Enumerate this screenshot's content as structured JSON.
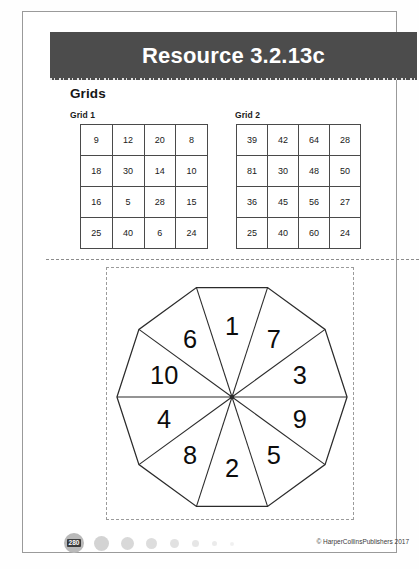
{
  "header": {
    "title": "Resource 3.2.13c",
    "band_color": "#4c4c4c",
    "title_color": "#ffffff"
  },
  "section": {
    "heading": "Grids"
  },
  "grids": [
    {
      "label": "Grid 1",
      "rows": [
        [
          "9",
          "12",
          "20",
          "8"
        ],
        [
          "18",
          "30",
          "14",
          "10"
        ],
        [
          "16",
          "5",
          "28",
          "15"
        ],
        [
          "25",
          "40",
          "6",
          "24"
        ]
      ]
    },
    {
      "label": "Grid 2",
      "rows": [
        [
          "39",
          "42",
          "64",
          "28"
        ],
        [
          "81",
          "30",
          "48",
          "50"
        ],
        [
          "36",
          "45",
          "56",
          "27"
        ],
        [
          "25",
          "40",
          "60",
          "24"
        ]
      ]
    }
  ],
  "spinner": {
    "name": "decagon-spinner",
    "sides": 10,
    "sectors_clockwise_from_top": [
      "1",
      "7",
      "3",
      "9",
      "5",
      "2",
      "8",
      "4",
      "10",
      "6"
    ],
    "outline_color": "#2b2b2b",
    "fill_color": "#ffffff"
  },
  "footer": {
    "page_number": "280",
    "copyright": "© HarperCollinsPublishers 2017",
    "dot_count": 7
  }
}
